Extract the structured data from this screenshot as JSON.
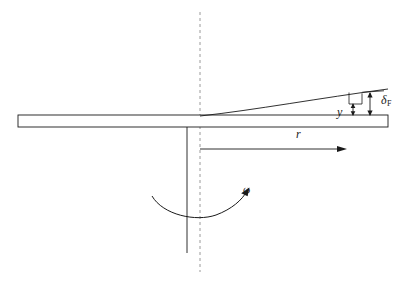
{
  "figure": {
    "domain": "Diagram",
    "background_color": "#ffffff",
    "line_color": "#1a1a1a",
    "dashed_color": "#999999",
    "width": 406,
    "height": 285
  },
  "labels": {
    "radius": "r",
    "local_deflection": "y",
    "tip_deflection_symbol": "δ",
    "tip_deflection_subscript": "F",
    "angular_velocity": "ω"
  },
  "elements": {
    "beam": {
      "name": "horizontal beam",
      "x": 18,
      "y": 115,
      "width": 370,
      "height": 12
    },
    "shaft": {
      "name": "vertical rotation shaft",
      "x": 187,
      "y_top": 127,
      "y_bottom": 253
    },
    "centerline": {
      "name": "dashed vertical centerline",
      "x": 200,
      "y_top": 12,
      "y_bottom": 272,
      "dash_pattern": "3 3"
    },
    "deflection_curve": {
      "name": "deflected beam elastic curve",
      "start_x": 200,
      "start_y": 116,
      "end_x": 388,
      "end_y": 90
    },
    "radius_dimension": {
      "name": "radial distance dimension arrow",
      "x_start": 200,
      "x_end": 346,
      "y": 149
    },
    "rotation_arrow": {
      "name": "curved angular velocity arrow",
      "x_start": 152,
      "y_start": 196,
      "x_end": 248,
      "y_end": 190,
      "direction": "counterclockwise-to-right"
    },
    "tip_deflection_dimension": {
      "name": "tip deflection double arrow",
      "x": 370,
      "y_top": 92,
      "y_bottom": 116
    },
    "local_deflection_dimension": {
      "name": "local deflection double arrow",
      "x": 353,
      "y_top": 103,
      "y_bottom": 116
    },
    "step_bracket": {
      "name": "right angle step bracket",
      "x_left": 349,
      "x_right": 362,
      "y_top": 92,
      "y_bottom": 104
    }
  }
}
